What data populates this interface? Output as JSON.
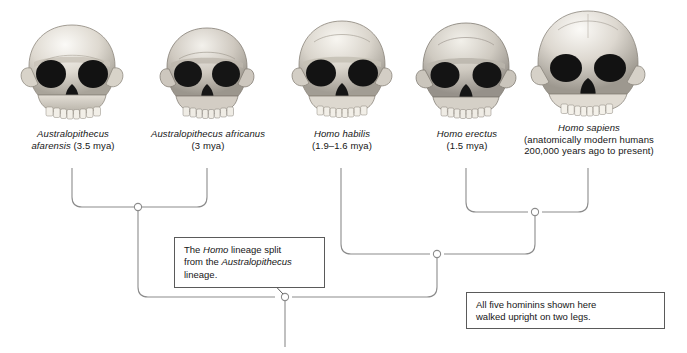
{
  "figure": {
    "background_color": "#ffffff",
    "line_color": "#8c8c8c",
    "text_color": "#161616"
  },
  "taxa": [
    {
      "id": "australopithecus-afarensis",
      "icon": "skull-icon",
      "name": "Australopithecus afarensis",
      "name_line1": "Australopithecus",
      "name_line2": "afarensis",
      "age_text": "(3.5 mya)",
      "line2_full": "afarensis (3.5 mya)"
    },
    {
      "id": "australopithecus-africanus",
      "icon": "skull-icon",
      "name": "Australopithecus africanus",
      "name_line1": "Australopithecus africanus",
      "name_line2": "",
      "age_text": "(3 mya)",
      "line2_full": "(3 mya)"
    },
    {
      "id": "homo-habilis",
      "icon": "skull-icon",
      "name": "Homo habilis",
      "name_line1": "Homo habilis",
      "name_line2": "",
      "age_text": "(1.9–1.6 mya)",
      "line2_full": "(1.9–1.6 mya)"
    },
    {
      "id": "homo-erectus",
      "icon": "skull-icon",
      "name": "Homo erectus",
      "name_line1": "Homo erectus",
      "name_line2": "",
      "age_text": "(1.5 mya)",
      "line2_full": "(1.5 mya)"
    },
    {
      "id": "homo-sapiens",
      "icon": "skull-icon",
      "name": "Homo sapiens",
      "name_line1": "Homo sapiens",
      "name_line2": "(anatomically modern humans",
      "age_text": "200,000 years ago to present)",
      "line2_full": "(anatomically modern humans"
    }
  ],
  "callouts": {
    "split": {
      "line1_pre": "The ",
      "line1_em": "Homo",
      "line1_post": " lineage split",
      "line2_pre": "from the ",
      "line2_em": "Australopithecus",
      "line2_post": "",
      "line3": "lineage."
    },
    "upright": {
      "line1": "All five hominins shown here",
      "line2": "walked upright on two legs."
    }
  },
  "tree": {
    "nodes": [
      {
        "id": "node-australopithecus",
        "x": 138,
        "y": 207,
        "label": "Australopithecus split node"
      },
      {
        "id": "node-erectus-sapiens",
        "x": 535,
        "y": 212,
        "label": "Homo erectus / sapiens node"
      },
      {
        "id": "node-homo",
        "x": 437,
        "y": 254,
        "label": "Homo lineage node"
      },
      {
        "id": "node-root",
        "x": 285,
        "y": 297,
        "label": "Common ancestor root node"
      }
    ],
    "tips_x": [
      72,
      207,
      341,
      466,
      588
    ],
    "tips_top_y": 168,
    "stem_bottom_y": 347
  }
}
